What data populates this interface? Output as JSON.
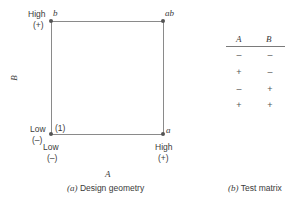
{
  "geometry": {
    "corners": {
      "top_left": "b",
      "top_right": "ab",
      "bottom_left": "(1)",
      "bottom_right": "a"
    },
    "y_axis": {
      "label": "B",
      "high": "High",
      "high_sign": "(+)",
      "low": "Low",
      "low_sign": "(–)"
    },
    "x_axis": {
      "label": "A",
      "high": "High",
      "high_sign": "(+)",
      "low": "Low",
      "low_sign": "(–)"
    },
    "caption_prefix": "(a)",
    "caption_text": "Design geometry"
  },
  "matrix": {
    "headers": [
      "A",
      "B"
    ],
    "rows": [
      [
        "–",
        "–"
      ],
      [
        "+",
        "–"
      ],
      [
        "–",
        "+"
      ],
      [
        "+",
        "+"
      ]
    ],
    "caption_prefix": "(b)",
    "caption_text": "Test matrix"
  }
}
